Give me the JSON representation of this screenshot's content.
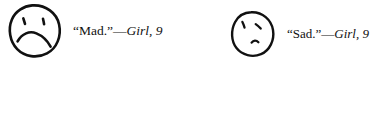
{
  "figure": {
    "background_color": "#ffffff",
    "ink_color": "#111111",
    "items": [
      {
        "id": "mad",
        "face_name": "mad-face-drawing",
        "expression": "mad",
        "quote": "“Mad.”",
        "dash": "—",
        "attribution": "Girl, 9"
      },
      {
        "id": "sad",
        "face_name": "sad-face-drawing",
        "expression": "sad",
        "quote": "“Sad.”",
        "dash": "—",
        "attribution": "Girl, 9"
      }
    ]
  }
}
